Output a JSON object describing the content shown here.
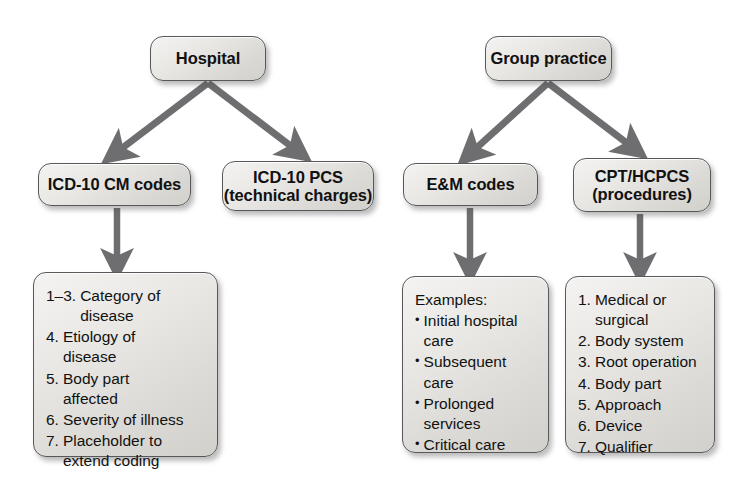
{
  "diagram": {
    "colors": {
      "box_fill": "#e8e7e4",
      "box_border": "#58585a",
      "arrow": "#6e6e70",
      "text": "#111111",
      "background": "#ffffff"
    },
    "nodes": {
      "hospital": {
        "label": "Hospital"
      },
      "group_practice": {
        "label": "Group practice"
      },
      "icd10_cm": {
        "label": "ICD-10 CM codes"
      },
      "icd10_pcs": {
        "label": "ICD-10 PCS\n(technical charges)"
      },
      "em_codes": {
        "label": "E&M codes"
      },
      "cpt_hcpcs": {
        "label": "CPT/HCPCS\n(procedures)"
      }
    },
    "details": {
      "icd10_cm_detail": {
        "items": [
          {
            "marker": "1–3.",
            "text": "Category of\ndisease"
          },
          {
            "marker": "4.",
            "text": "Etiology of\ndisease"
          },
          {
            "marker": "5.",
            "text": "Body part\naffected"
          },
          {
            "marker": "6.",
            "text": "Severity of illness"
          },
          {
            "marker": "7.",
            "text": "Placeholder to\nextend coding"
          }
        ]
      },
      "em_detail": {
        "heading": "Examples:",
        "items": [
          {
            "marker": "•",
            "text": "Initial hospital\ncare"
          },
          {
            "marker": "•",
            "text": "Subsequent\ncare"
          },
          {
            "marker": "•",
            "text": "Prolonged\nservices"
          },
          {
            "marker": "•",
            "text": "Critical care"
          }
        ]
      },
      "cpt_detail": {
        "items": [
          {
            "marker": "1.",
            "text": "Medical or\nsurgical"
          },
          {
            "marker": "2.",
            "text": "Body system"
          },
          {
            "marker": "3.",
            "text": "Root operation"
          },
          {
            "marker": "4.",
            "text": "Body part"
          },
          {
            "marker": "5.",
            "text": "Approach"
          },
          {
            "marker": "6.",
            "text": "Device"
          },
          {
            "marker": "7.",
            "text": "Qualifier"
          }
        ]
      }
    },
    "connectors": [
      {
        "name": "hospital-to-icd10cm",
        "from": "hospital",
        "to": "icd10_cm",
        "kind": "diagonal-arrow"
      },
      {
        "name": "hospital-to-icd10pcs",
        "from": "hospital",
        "to": "icd10_pcs",
        "kind": "diagonal-arrow"
      },
      {
        "name": "group-to-em",
        "from": "group_practice",
        "to": "em_codes",
        "kind": "diagonal-arrow"
      },
      {
        "name": "group-to-cpt",
        "from": "group_practice",
        "to": "cpt_hcpcs",
        "kind": "diagonal-arrow"
      },
      {
        "name": "icd10cm-to-detail",
        "from": "icd10_cm",
        "to": "icd10_cm_detail",
        "kind": "vertical-arrow"
      },
      {
        "name": "em-to-detail",
        "from": "em_codes",
        "to": "em_detail",
        "kind": "vertical-arrow"
      },
      {
        "name": "cpt-to-detail",
        "from": "cpt_hcpcs",
        "to": "cpt_detail",
        "kind": "vertical-arrow"
      }
    ]
  }
}
